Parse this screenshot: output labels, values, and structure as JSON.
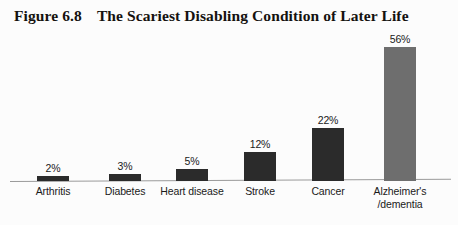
{
  "figure": {
    "number": "Figure 6.8",
    "title": "The Scariest Disabling Condition of Later Life"
  },
  "chart_data": {
    "type": "bar",
    "title": "The Scariest Disabling Condition of Later Life",
    "xlabel": "",
    "ylabel": "",
    "ylim": [
      0,
      60
    ],
    "grid": false,
    "legend": null,
    "categories": [
      "Arthritis",
      "Diabetes",
      "Heart disease",
      "Stroke",
      "Cancer",
      "Alzheimer's\n/dementia"
    ],
    "values": [
      2,
      3,
      5,
      12,
      22,
      56
    ],
    "value_labels": [
      "2%",
      "3%",
      "5%",
      "12%",
      "22%",
      "56%"
    ],
    "bar_colors": [
      "#2b2b2b",
      "#2b2b2b",
      "#2b2b2b",
      "#2b2b2b",
      "#2b2b2b",
      "#6e6e6e"
    ],
    "axis_color": "#9a9a9a",
    "background": "#fcfcfc"
  }
}
